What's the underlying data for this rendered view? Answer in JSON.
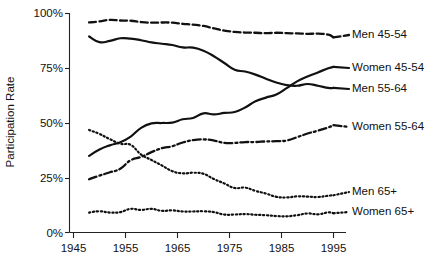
{
  "chart_data": {
    "type": "line",
    "title": "",
    "xlabel": "",
    "ylabel": "Participation Rate",
    "xlim": [
      1945,
      1997
    ],
    "ylim": [
      0,
      100
    ],
    "xticks": [
      1945,
      1955,
      1965,
      1975,
      1985,
      1995
    ],
    "xticklabels": [
      "1945",
      "1955",
      "1965",
      "1975",
      "1985",
      "1995"
    ],
    "yticks": [
      0,
      25,
      50,
      75,
      100
    ],
    "yticklabels": [
      "0%",
      "25%",
      "50%",
      "75%",
      "100%"
    ],
    "grid": false,
    "legend_position": "right-inline-labels",
    "series": [
      {
        "name": "Men 45-54",
        "label": "Men 45-54",
        "style": "dashed",
        "x": [
          1948,
          1950,
          1952,
          1954,
          1956,
          1958,
          1960,
          1962,
          1964,
          1966,
          1968,
          1970,
          1972,
          1974,
          1976,
          1978,
          1980,
          1982,
          1984,
          1986,
          1988,
          1990,
          1992,
          1994,
          1995
        ],
        "values": [
          95.9,
          96.4,
          97.1,
          96.8,
          96.7,
          96.1,
          95.8,
          95.9,
          95.8,
          95.3,
          94.9,
          94.3,
          93.2,
          92.2,
          91.6,
          91.3,
          91.2,
          91.0,
          91.2,
          91.0,
          90.9,
          90.7,
          90.8,
          90.3,
          89.1
        ]
      },
      {
        "name": "Men 55-64",
        "label": "Men 55-64",
        "style": "solid",
        "x": [
          1948,
          1950,
          1952,
          1954,
          1956,
          1958,
          1960,
          1962,
          1964,
          1966,
          1968,
          1970,
          1972,
          1974,
          1976,
          1978,
          1980,
          1982,
          1984,
          1986,
          1988,
          1990,
          1992,
          1994,
          1995
        ],
        "values": [
          89.5,
          86.9,
          87.5,
          88.7,
          88.5,
          87.8,
          86.8,
          86.2,
          85.6,
          84.5,
          84.4,
          83.0,
          80.5,
          77.4,
          74.3,
          73.5,
          72.1,
          70.2,
          68.5,
          67.3,
          67.0,
          67.8,
          67.0,
          66.0,
          66.0
        ]
      },
      {
        "name": "Women 45-54",
        "label": "Women 45-54",
        "style": "solid",
        "x": [
          1948,
          1950,
          1952,
          1954,
          1956,
          1958,
          1960,
          1962,
          1964,
          1966,
          1968,
          1970,
          1972,
          1974,
          1976,
          1978,
          1980,
          1982,
          1984,
          1986,
          1988,
          1990,
          1992,
          1994,
          1995
        ],
        "values": [
          35.0,
          37.9,
          39.8,
          41.2,
          43.8,
          47.8,
          49.8,
          50.0,
          50.2,
          51.7,
          52.3,
          54.4,
          53.9,
          54.6,
          55.0,
          57.1,
          59.9,
          61.6,
          63.0,
          65.9,
          69.0,
          71.2,
          73.1,
          75.0,
          75.6
        ]
      },
      {
        "name": "Women 55-64",
        "label": "Women 55-64",
        "style": "dashdot",
        "x": [
          1948,
          1950,
          1952,
          1954,
          1956,
          1958,
          1960,
          1962,
          1964,
          1966,
          1968,
          1970,
          1972,
          1974,
          1976,
          1978,
          1980,
          1982,
          1984,
          1986,
          1988,
          1990,
          1992,
          1994,
          1995
        ],
        "values": [
          24.3,
          26.0,
          27.5,
          29.1,
          33.0,
          34.5,
          36.7,
          38.5,
          39.4,
          41.1,
          42.2,
          42.5,
          42.0,
          40.9,
          40.9,
          41.3,
          41.3,
          41.6,
          41.7,
          42.0,
          43.5,
          45.2,
          46.5,
          48.0,
          49.0
        ]
      },
      {
        "name": "Men 65+",
        "label": "Men 65+",
        "style": "dotted",
        "x": [
          1948,
          1950,
          1952,
          1954,
          1956,
          1958,
          1960,
          1962,
          1964,
          1966,
          1968,
          1970,
          1972,
          1974,
          1976,
          1978,
          1980,
          1982,
          1984,
          1986,
          1988,
          1990,
          1992,
          1994,
          1995
        ],
        "values": [
          46.8,
          45.0,
          42.6,
          40.5,
          40.0,
          35.6,
          33.1,
          30.6,
          28.0,
          27.0,
          27.3,
          26.8,
          24.4,
          22.4,
          20.3,
          20.5,
          19.0,
          17.8,
          16.3,
          16.0,
          16.5,
          16.4,
          16.2,
          16.8,
          17.0
        ]
      },
      {
        "name": "Women 65+",
        "label": "Women 65+",
        "style": "dotted",
        "x": [
          1948,
          1950,
          1952,
          1954,
          1956,
          1958,
          1960,
          1962,
          1964,
          1966,
          1968,
          1970,
          1972,
          1974,
          1976,
          1978,
          1980,
          1982,
          1984,
          1986,
          1988,
          1990,
          1992,
          1994,
          1995
        ],
        "values": [
          9.1,
          9.7,
          9.1,
          9.3,
          10.8,
          10.3,
          10.8,
          9.9,
          10.1,
          9.6,
          9.6,
          9.7,
          9.3,
          8.2,
          8.2,
          8.4,
          8.1,
          7.9,
          7.5,
          7.4,
          7.9,
          8.7,
          8.3,
          9.2,
          8.8
        ]
      }
    ]
  },
  "labels": {
    "men_4554": "Men 45-54",
    "women_4554": "Women 45-54",
    "men_5564": "Men 55-64",
    "women_5564": "Women 55-64",
    "men_65": "Men 65+",
    "women_65": "Women 65+",
    "y_axis_title": "Participation Rate",
    "y_0": "0%",
    "y_25": "25%",
    "y_50": "50%",
    "y_75": "75%",
    "y_100": "100%",
    "x_1945": "1945",
    "x_1955": "1955",
    "x_1965": "1965",
    "x_1975": "1975",
    "x_1985": "1985",
    "x_1995": "1995"
  },
  "colors": {
    "line": "#111111",
    "axis": "#222222",
    "background": "#ffffff"
  }
}
